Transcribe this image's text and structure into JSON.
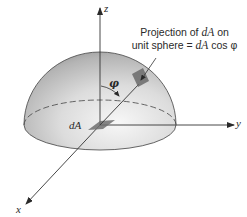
{
  "diagram": {
    "axes": {
      "z_label": "z",
      "y_label": "y",
      "x_label": "x"
    },
    "labels": {
      "area_element": "dA",
      "angle": "φ",
      "caption_line1_prefix": "Projection of ",
      "caption_line1_var": "dA",
      "caption_line1_suffix": " on",
      "caption_line2_prefix": "unit sphere = ",
      "caption_line2_var": "dA",
      "caption_line2_suffix": " cos φ"
    },
    "colors": {
      "line": "#3a3a3a",
      "hemisphere_light": "#f2f2f2",
      "hemisphere_dark": "#9a9a9a",
      "patch": "#7a7a7a",
      "background": "#ffffff"
    }
  }
}
